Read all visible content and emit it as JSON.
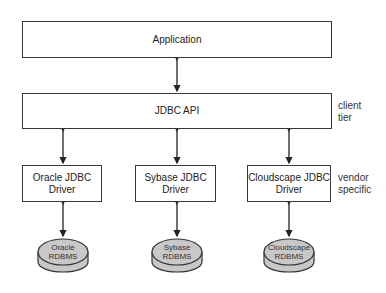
{
  "diagram": {
    "application": {
      "label": "Application"
    },
    "jdbc_api": {
      "label": "JDBC API"
    },
    "tiers": {
      "client": {
        "line1": "client",
        "line2": "tier"
      },
      "vendor": {
        "line1": "vendor",
        "line2": "specific"
      }
    },
    "drivers": [
      {
        "line1": "Oracle JDBC",
        "line2": "Driver"
      },
      {
        "line1": "Sybase JDBC",
        "line2": "Driver"
      },
      {
        "line1": "Cloudscape JDBC",
        "line2": "Driver"
      }
    ],
    "databases": [
      {
        "line1": "Oracle",
        "line2": "RDBMS"
      },
      {
        "line1": "Sybase",
        "line2": "RDBMS"
      },
      {
        "line1": "Cloudscape",
        "line2": "RDBMS"
      }
    ],
    "colors": {
      "stroke": "#3a3a3a",
      "db_fill": "#c8c8c8"
    }
  }
}
